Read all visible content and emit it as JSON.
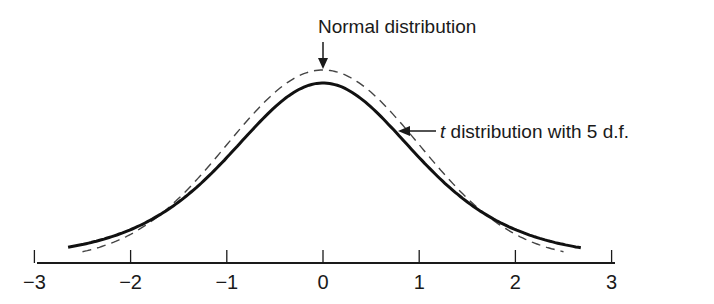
{
  "chart_data": {
    "type": "line",
    "title": "",
    "xlabel": "",
    "ylabel": "",
    "xlim": [
      -3,
      3
    ],
    "x_ticks": [
      -3,
      -2,
      -1,
      0,
      1,
      2,
      3
    ],
    "x_tick_labels": [
      "−3",
      "−2",
      "−1",
      "0",
      "1",
      "2",
      "3"
    ],
    "grid": false,
    "y_axis_visible": false,
    "series": [
      {
        "name": "Normal distribution",
        "style": "dashed",
        "color": "#333333",
        "x_range": [
          -2.5,
          2.5
        ],
        "peak_density": 0.3989,
        "x": [
          -2.5,
          -2,
          -1.5,
          -1,
          -0.5,
          0,
          0.5,
          1,
          1.5,
          2,
          2.5
        ],
        "values": [
          0.0175,
          0.054,
          0.1295,
          0.242,
          0.3521,
          0.3989,
          0.3521,
          0.242,
          0.1295,
          0.054,
          0.0175
        ]
      },
      {
        "name": "t distribution with 5 d.f.",
        "style": "solid",
        "color": "#111111",
        "df": 5,
        "x_range": [
          -2.65,
          2.68
        ],
        "peak_density": 0.3796,
        "x": [
          -2.5,
          -2,
          -1.5,
          -1,
          -0.5,
          0,
          0.5,
          1,
          1.5,
          2,
          2.5
        ],
        "values": [
          0.0247,
          0.0651,
          0.1245,
          0.2196,
          0.3279,
          0.3796,
          0.3279,
          0.2196,
          0.1245,
          0.0651,
          0.0247
        ]
      }
    ],
    "annotations": [
      {
        "text_prefix": "",
        "text": "Normal distribution",
        "points_to": "Normal distribution peak at x=0",
        "arrow": "down"
      },
      {
        "text_prefix": "t",
        "text": " distribution with 5 d.f.",
        "points_to": "t distribution curve near x=0.8",
        "arrow": "left"
      }
    ]
  },
  "labels": {
    "normal": "Normal distribution",
    "t_italic": "t",
    "t_rest": " distribution with 5 d.f."
  }
}
